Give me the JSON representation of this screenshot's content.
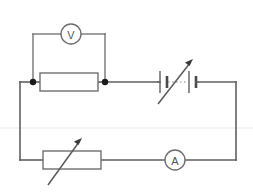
{
  "diagram": {
    "type": "schematic",
    "background_color": "#ffffff",
    "wire_color": "#5f5f5f",
    "junction_color": "#1b1b1b",
    "width": 253,
    "height": 193
  },
  "components": {
    "voltmeter": {
      "label": "V",
      "name": "voltmeter",
      "symbol": "circle-with-letter",
      "connection": "parallel across fixed resistor",
      "cx": 71,
      "cy": 34,
      "r": 10
    },
    "ammeter": {
      "label": "A",
      "name": "ammeter",
      "symbol": "circle-with-letter",
      "connection": "series in bottom branch",
      "cx": 175,
      "cy": 160,
      "r": 10
    },
    "fixed_resistor": {
      "label": "",
      "name": "fixed-resistor",
      "symbol": "rectangle",
      "x": 40,
      "y": 73,
      "width": 58,
      "height": 18
    },
    "variable_resistor": {
      "label": "",
      "name": "variable-resistor",
      "symbol": "rectangle-with-diagonal-arrow",
      "x": 43,
      "y": 151,
      "width": 58,
      "height": 18
    },
    "battery": {
      "label": "",
      "name": "variable-battery",
      "symbol": "two-cells-with-diagonal-arrow",
      "cells": 2,
      "center_x": 178,
      "center_y": 82
    }
  },
  "junctions": [
    {
      "name": "left-junction",
      "cx": 33,
      "cy": 82,
      "r": 3.2
    },
    {
      "name": "right-junction",
      "cx": 105,
      "cy": 82,
      "r": 3.2
    }
  ],
  "artifacts": {
    "scan_line_y": 128,
    "scan_line_color": "#f0f0f0"
  }
}
